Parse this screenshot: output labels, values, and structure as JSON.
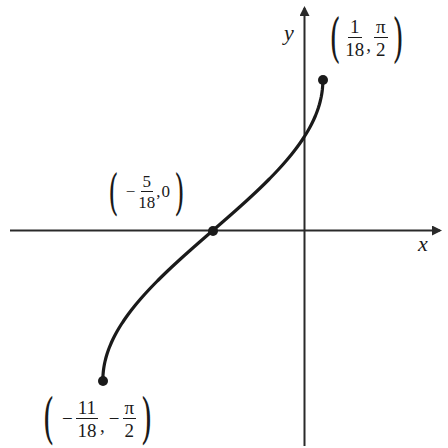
{
  "figure": {
    "function": "y = arcsin(3x + 5/6)",
    "axes": {
      "x_label": "x",
      "y_label": "y"
    },
    "points": [
      {
        "id": "top-endpoint",
        "x": "1/18",
        "y": "π/2",
        "x_num": "1",
        "x_den": "18",
        "x_sign": "",
        "y_num": "π",
        "y_den": "2",
        "y_sign": ""
      },
      {
        "id": "x-intercept",
        "x": "-5/18",
        "y": "0",
        "x_num": "5",
        "x_den": "18",
        "x_sign": "−",
        "y_value": "0"
      },
      {
        "id": "bottom-endpoint",
        "x": "-11/18",
        "y": "-π/2",
        "x_num": "11",
        "x_den": "18",
        "x_sign": "−",
        "y_num": "π",
        "y_den": "2",
        "y_sign": "−"
      }
    ],
    "colors": {
      "curve": "#1a1a1a",
      "axes": "#2a2a2a",
      "background": "#ffffff"
    }
  }
}
